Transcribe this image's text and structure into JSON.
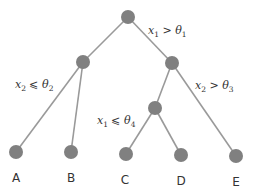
{
  "diagram": {
    "type": "decision-tree",
    "colors": {
      "node": "#808080",
      "edge": "#9a9a9a",
      "text": "#333333"
    },
    "nodes": [
      {
        "id": "root",
        "x": 128,
        "y": 17,
        "r": 7
      },
      {
        "id": "left",
        "x": 83,
        "y": 62,
        "r": 7
      },
      {
        "id": "right",
        "x": 172,
        "y": 63,
        "r": 7
      },
      {
        "id": "inner",
        "x": 155,
        "y": 108,
        "r": 7
      },
      {
        "id": "A",
        "x": 16,
        "y": 152,
        "r": 7
      },
      {
        "id": "B",
        "x": 71,
        "y": 152,
        "r": 7
      },
      {
        "id": "C",
        "x": 126,
        "y": 154,
        "r": 7
      },
      {
        "id": "D",
        "x": 181,
        "y": 155,
        "r": 7
      },
      {
        "id": "E",
        "x": 236,
        "y": 156,
        "r": 7
      }
    ],
    "edges": [
      [
        "root",
        "left"
      ],
      [
        "root",
        "right"
      ],
      [
        "left",
        "A"
      ],
      [
        "left",
        "B"
      ],
      [
        "right",
        "inner"
      ],
      [
        "right",
        "E"
      ],
      [
        "inner",
        "C"
      ],
      [
        "inner",
        "D"
      ]
    ],
    "conditions": [
      {
        "var": "x",
        "var_sub": "1",
        "op": ">",
        "th": "θ",
        "th_sub": "1",
        "x": 148,
        "y": 34
      },
      {
        "var": "x",
        "var_sub": "2",
        "op": "⩽",
        "th": "θ",
        "th_sub": "2",
        "x": 15,
        "y": 88
      },
      {
        "var": "x",
        "var_sub": "2",
        "op": ">",
        "th": "θ",
        "th_sub": "3",
        "x": 195,
        "y": 89
      },
      {
        "var": "x",
        "var_sub": "1",
        "op": "⩽",
        "th": "θ",
        "th_sub": "4",
        "x": 97,
        "y": 124
      }
    ],
    "leaves": [
      {
        "label": "A",
        "x": 16,
        "y": 182
      },
      {
        "label": "B",
        "x": 71,
        "y": 182
      },
      {
        "label": "C",
        "x": 125,
        "y": 184
      },
      {
        "label": "D",
        "x": 181,
        "y": 185
      },
      {
        "label": "E",
        "x": 236,
        "y": 186
      }
    ]
  }
}
